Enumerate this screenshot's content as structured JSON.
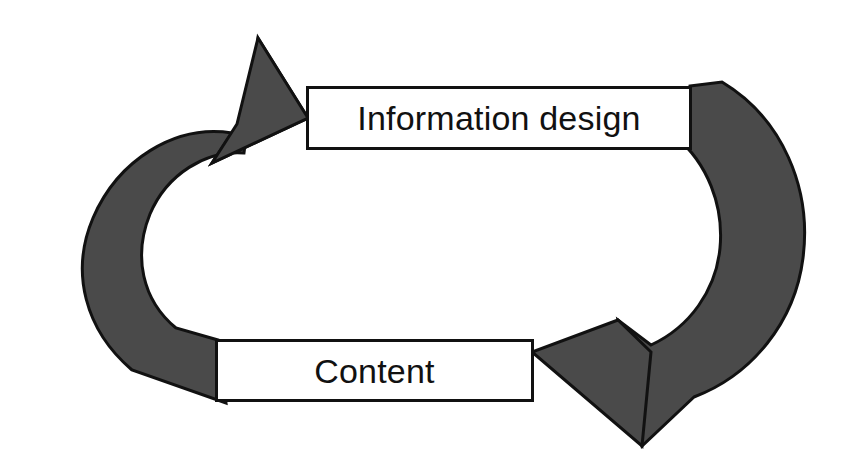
{
  "diagram": {
    "type": "cycle",
    "title": "",
    "background_color": "#ffffff",
    "arrow_fill_color": "#4a4a4a",
    "arrow_stroke_color": "#111111",
    "box_fill_color": "#ffffff",
    "box_border_color": "#111111",
    "text_color": "#111111",
    "nodes": [
      {
        "id": "information-design",
        "label": "Information design",
        "x": 306,
        "y": 86,
        "width": 386,
        "height": 64
      },
      {
        "id": "content",
        "label": "Content",
        "x": 215,
        "y": 339,
        "width": 319,
        "height": 63
      }
    ],
    "arrows": [
      {
        "id": "content-to-information-design",
        "from": "content",
        "to": "information-design",
        "direction": "counterclockwise-left",
        "points_to": "Information design"
      },
      {
        "id": "information-design-to-content",
        "from": "information-design",
        "to": "content",
        "direction": "clockwise-right",
        "points_to": "Content"
      }
    ]
  }
}
